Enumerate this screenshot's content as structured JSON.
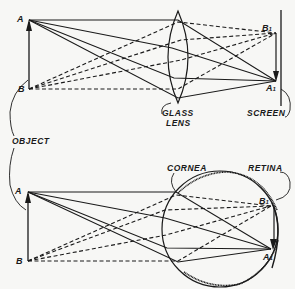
{
  "diagram": {
    "title": "",
    "colors": {
      "ink": "#1a1a1a",
      "background": "#f7f7f5"
    },
    "top_panel": {
      "description": "Image formation by a glass lens onto a screen",
      "object_points": {
        "top": "A",
        "bottom": "B"
      },
      "image_points": {
        "top": "B",
        "top_sub": "1",
        "bottom": "A",
        "bottom_sub": "1"
      },
      "labels": {
        "lens_line1": "GLASS",
        "lens_line2": "LENS",
        "screen": "SCREEN"
      }
    },
    "shared": {
      "object_label": "OBJECT"
    },
    "bottom_panel": {
      "description": "Image formation by the eye onto the retina",
      "object_points": {
        "top": "A",
        "bottom": "B"
      },
      "image_points": {
        "top": "B",
        "top_sub": "1",
        "bottom": "A",
        "bottom_sub": "1"
      },
      "labels": {
        "cornea": "CORNEA",
        "retina": "RETINA"
      }
    },
    "line_styles": {
      "rays_from_A": "solid",
      "rays_from_B": "dashed"
    }
  }
}
